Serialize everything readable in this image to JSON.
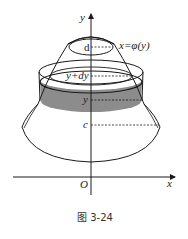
{
  "figure": {
    "caption": "图 3-24",
    "labels": {
      "y_axis": "y",
      "x_axis": "x",
      "origin": "O",
      "d": "d",
      "curve": "x=φ(y)",
      "y_plus_dy": "y+dy",
      "y": "y",
      "c": "c"
    },
    "colors": {
      "stroke": "#1a1a1a",
      "band_fill": "#8c8c8c",
      "background": "#ffffff"
    }
  }
}
